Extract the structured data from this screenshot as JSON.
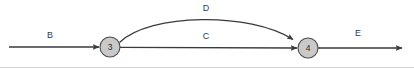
{
  "diagram": {
    "type": "directed-graph",
    "canvas": {
      "width": 414,
      "height": 69,
      "background": "#ffffff"
    },
    "colors": {
      "node_fill": "#c9c9c9",
      "node_stroke": "#4a4a4a",
      "edge": "#3a3a3a",
      "text": "#3b3b3b",
      "frame": "#d6d6d6"
    },
    "nodes": [
      {
        "id": "3",
        "label": "3",
        "cx": 110,
        "cy": 47,
        "r": 10
      },
      {
        "id": "4",
        "label": "4",
        "cx": 308,
        "cy": 48,
        "r": 10
      }
    ],
    "edges": [
      {
        "id": "B",
        "label": "B",
        "from": "start",
        "to": "3",
        "shape": "straight",
        "label_x": 50,
        "label_y": 36
      },
      {
        "id": "C",
        "label": "C",
        "from": "3",
        "to": "4",
        "shape": "straight",
        "label_x": 206,
        "label_y": 37
      },
      {
        "id": "D",
        "label": "D",
        "from": "3",
        "to": "4",
        "shape": "curved-above",
        "label_x": 206,
        "label_y": 9
      },
      {
        "id": "E",
        "label": "E",
        "from": "4",
        "to": "end",
        "shape": "straight",
        "label_x": 358,
        "label_y": 34
      }
    ]
  }
}
